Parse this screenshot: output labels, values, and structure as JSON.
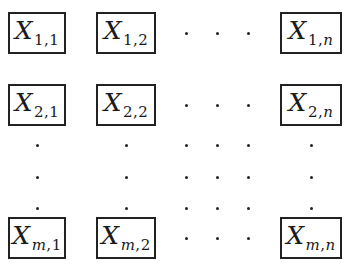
{
  "figure": {
    "type": "matrix-of-boxes",
    "variable": "X",
    "rows": [
      {
        "row_label": "1",
        "cells": [
          {
            "sub_row": "1",
            "sub_col": "1"
          },
          {
            "sub_row": "1",
            "sub_col": "2"
          },
          {
            "sub_row": "1",
            "sub_col": "n"
          }
        ]
      },
      {
        "row_label": "2",
        "cells": [
          {
            "sub_row": "2",
            "sub_col": "1"
          },
          {
            "sub_row": "2",
            "sub_col": "2"
          },
          {
            "sub_row": "2",
            "sub_col": "n"
          }
        ]
      },
      {
        "row_label": "m",
        "cells": [
          {
            "sub_row": "m",
            "sub_col": "1"
          },
          {
            "sub_row": "m",
            "sub_col": "2"
          },
          {
            "sub_row": "m",
            "sub_col": "n"
          }
        ]
      }
    ],
    "separator": ",",
    "ellipsis_glyph": "·"
  },
  "colors": {
    "border": "#222222",
    "text": "#1a1a1a",
    "background": "#ffffff"
  }
}
